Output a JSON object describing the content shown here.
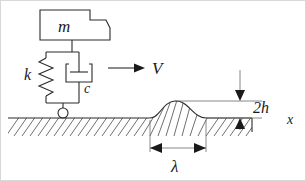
{
  "figure": {
    "labels": {
      "mass": "m",
      "spring": "k",
      "damper": "c",
      "velocity": "V",
      "bump_height": "2h",
      "coordinate": "x",
      "wavelength": "λ"
    },
    "colors": {
      "line": "#2b2b2b",
      "hatch": "#4a4a4a",
      "dimension": "#6a6a6a",
      "background": "#ffffff",
      "frame": "#d8d8d8"
    },
    "elements": [
      {
        "name": "mass-block",
        "label": "m",
        "kind": "polygon"
      },
      {
        "name": "spring",
        "label": "k",
        "kind": "zigzag"
      },
      {
        "name": "damper",
        "label": "c",
        "kind": "dashpot"
      },
      {
        "name": "wheel",
        "label": "",
        "kind": "circle"
      },
      {
        "name": "ground",
        "label": "",
        "kind": "hatched-line"
      },
      {
        "name": "road-bump",
        "label": "2h",
        "kind": "sinusoidal-hump"
      },
      {
        "name": "velocity-arrow",
        "label": "V",
        "kind": "arrow-right"
      },
      {
        "name": "height-dimension",
        "label": "2h",
        "kind": "double-arrow-vertical"
      },
      {
        "name": "wavelength-dimension",
        "label": "λ",
        "kind": "double-arrow-horizontal"
      },
      {
        "name": "axis-label-x",
        "label": "x",
        "kind": "text"
      }
    ]
  }
}
